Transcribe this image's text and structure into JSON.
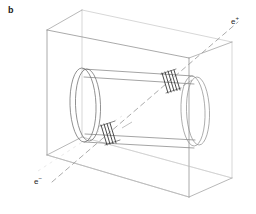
{
  "figure": {
    "panel_label": "b",
    "width": 256,
    "height": 214,
    "background_color": "#ffffff"
  },
  "labels": {
    "positron": {
      "symbol": "e",
      "charge": "+",
      "x": 231,
      "y": 18
    },
    "electron": {
      "symbol": "e",
      "charge": "−",
      "x": 34,
      "y": 178
    }
  },
  "colors": {
    "box_stroke": "#8a8a8a",
    "box_stroke_back": "#b8b8b8",
    "cylinder_stroke": "#707070",
    "cylinder_stroke_back": "#a6a6a6",
    "beam_stroke": "#9a9a9a",
    "marker_stroke": "#2a2a2a",
    "label_text": "#262626",
    "panel_text": "#1a1a1a"
  },
  "geometry": {
    "box": {
      "front_top_left": [
        47,
        30
      ],
      "front_top_right": [
        189,
        58
      ],
      "front_bottom_right": [
        189,
        197
      ],
      "front_bottom_left": [
        47,
        155
      ],
      "back_top_left": [
        82,
        10
      ],
      "back_top_right": [
        232,
        42
      ],
      "back_bottom_right": [
        232,
        178
      ],
      "back_bottom_left": [
        82,
        137
      ]
    },
    "cylinder": {
      "left_cap_center": [
        83,
        105
      ],
      "left_cap_rx": 13,
      "left_cap_ry": 37,
      "right_cap_center": [
        193,
        110
      ],
      "right_cap_rx": 12,
      "right_cap_ry": 35,
      "axis_tilt_deg": 3
    },
    "beam_axis": {
      "start": [
        52,
        182
      ],
      "end": [
        238,
        22
      ],
      "dash_pattern": "5 4"
    },
    "markers": [
      {
        "name": "upper-hatched-band",
        "x": 168,
        "y": 82,
        "hatch_count": 5
      },
      {
        "name": "lower-hatched-band",
        "x": 107,
        "y": 134,
        "hatch_count": 4
      }
    ]
  }
}
